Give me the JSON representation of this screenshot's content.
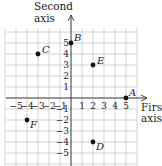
{
  "chart_data": {
    "type": "scatter",
    "title": "",
    "xlabel": "First axis",
    "ylabel": "Second axis",
    "xlabel_lines": [
      "First",
      "axis"
    ],
    "ylabel_lines": [
      "Second",
      "axis"
    ],
    "xlim": [
      -6,
      6
    ],
    "ylim": [
      -6,
      6
    ],
    "grid": true,
    "x_ticks": [
      -5,
      -4,
      -3,
      -2,
      -1,
      1,
      2,
      3,
      4,
      5
    ],
    "y_ticks": [
      -5,
      -4,
      -3,
      -2,
      -1,
      1,
      2,
      3,
      4,
      5
    ],
    "x_tick_labels": [
      "−5",
      "−4",
      "−3",
      "−2",
      "−1",
      "1",
      "2",
      "3",
      "4",
      "5"
    ],
    "y_tick_labels": [
      "−5",
      "−4",
      "−3",
      "−2",
      "−1",
      "1",
      "2",
      "3",
      "4",
      "5"
    ],
    "points": [
      {
        "label": "A",
        "x": 5,
        "y": 0
      },
      {
        "label": "B",
        "x": 0,
        "y": 5
      },
      {
        "label": "C",
        "x": -3,
        "y": 4
      },
      {
        "label": "D",
        "x": 2,
        "y": -4
      },
      {
        "label": "E",
        "x": 2,
        "y": 3
      },
      {
        "label": "F",
        "x": -4,
        "y": -2
      }
    ],
    "colors": {
      "grid": "#c8c8c8",
      "axis": "#333333",
      "point": "#111111"
    }
  }
}
